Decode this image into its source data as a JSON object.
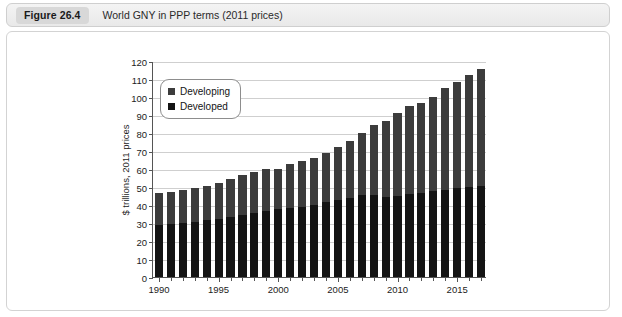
{
  "figure": {
    "number": "Figure 26.4",
    "caption": "World GNY in PPP terms (2011 prices)"
  },
  "legend": {
    "position": "top-left-inside",
    "items": [
      {
        "label": "Developing",
        "color": "#3c3c3c",
        "swatch": "square-swatch"
      },
      {
        "label": "Developed",
        "color": "#141414",
        "swatch": "square-swatch"
      }
    ]
  },
  "chart_data": {
    "type": "bar",
    "stacked": true,
    "title": "World GNY in PPP terms (2011 prices)",
    "xlabel": "",
    "ylabel": "$ trillions, 2011 prices",
    "ylim": [
      0,
      120
    ],
    "yticks": [
      0,
      10,
      20,
      30,
      40,
      50,
      60,
      70,
      80,
      90,
      100,
      110,
      120
    ],
    "grid": true,
    "xlim": [
      1990,
      2017
    ],
    "xticks": [
      1990,
      1995,
      2000,
      2005,
      2010,
      2015
    ],
    "xtick_labels": [
      "1990",
      "1995",
      "2000",
      "2005",
      "2010",
      "2015"
    ],
    "categories": [
      1990,
      1991,
      1992,
      1993,
      1994,
      1995,
      1996,
      1997,
      1998,
      1999,
      2000,
      2001,
      2002,
      2003,
      2004,
      2005,
      2006,
      2007,
      2008,
      2009,
      2010,
      2011,
      2012,
      2013,
      2014,
      2015,
      2016,
      2017
    ],
    "series": [
      {
        "name": "Developed",
        "color": "#141414",
        "values": [
          29.0,
          29.3,
          30.0,
          30.4,
          31.5,
          32.1,
          33.4,
          34.6,
          35.4,
          36.6,
          38.0,
          38.4,
          39.0,
          40.0,
          41.5,
          42.8,
          44.0,
          45.3,
          45.6,
          44.2,
          45.2,
          45.9,
          46.6,
          47.6,
          48.5,
          49.2,
          50.0,
          50.7
        ]
      },
      {
        "name": "Developing",
        "color": "#3c3c3c",
        "values": [
          17.8,
          18.2,
          18.6,
          19.1,
          19.3,
          20.4,
          21.1,
          22.2,
          22.7,
          23.3,
          22.0,
          24.2,
          25.2,
          26.0,
          27.3,
          29.5,
          31.8,
          34.6,
          38.7,
          42.4,
          45.8,
          48.9,
          50.3,
          52.5,
          56.3,
          59.4,
          62.3,
          65.1
        ]
      }
    ],
    "totals": [
      46.8,
      47.5,
      48.6,
      49.5,
      50.8,
      52.5,
      54.5,
      56.8,
      58.1,
      59.9,
      60.0,
      62.6,
      64.2,
      66.0,
      68.8,
      72.3,
      75.8,
      79.9,
      84.3,
      86.6,
      91.0,
      94.8,
      96.9,
      100.1,
      104.8,
      108.6,
      112.3,
      115.8
    ]
  }
}
